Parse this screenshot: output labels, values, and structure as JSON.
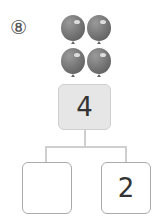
{
  "problem": {
    "number": "⑧",
    "balloon_count": 4,
    "balloon_color": "#7a7a7a",
    "top_box": {
      "value": "4",
      "fill": "#e6e6e6"
    },
    "left_box": {
      "value": ""
    },
    "right_box": {
      "value": "2"
    }
  }
}
